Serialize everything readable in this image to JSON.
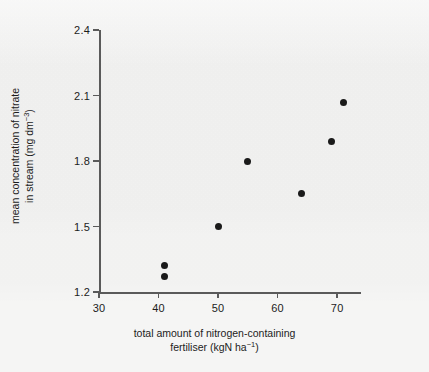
{
  "chart_data": {
    "type": "scatter",
    "title": "",
    "xlabel_line1": "total amount of nitrogen-containing",
    "xlabel_line2_pre": "fertiliser (kgN ha",
    "xlabel_line2_sup": "−1",
    "xlabel_line2_post": ")",
    "ylabel_line1": "mean concentration of nitrate",
    "ylabel_line2_pre": "in stream (mg dm",
    "ylabel_line2_sup": "−3",
    "ylabel_line2_post": ")",
    "xlim": [
      30,
      74
    ],
    "ylim": [
      1.2,
      2.4
    ],
    "xticks": [
      30,
      40,
      50,
      60,
      70
    ],
    "xtick_labels": [
      "30",
      "40",
      "50",
      "60",
      "70"
    ],
    "yticks": [
      1.2,
      1.5,
      1.8,
      2.1,
      2.4
    ],
    "ytick_labels": [
      "1.2",
      "1.5",
      "1.8",
      "2.1",
      "2.4"
    ],
    "grid": false,
    "legend": false,
    "marker_color": "#1a1a1a",
    "axis_color": "#5a5a5a",
    "background_color": "#f5f5f4",
    "points": [
      {
        "x": 41,
        "y": 1.32
      },
      {
        "x": 41,
        "y": 1.27
      },
      {
        "x": 50,
        "y": 1.5
      },
      {
        "x": 55,
        "y": 1.8
      },
      {
        "x": 64,
        "y": 1.65
      },
      {
        "x": 69,
        "y": 1.89
      },
      {
        "x": 71,
        "y": 2.07
      }
    ],
    "x": [
      41,
      41,
      50,
      55,
      64,
      69,
      71
    ],
    "values": [
      1.32,
      1.27,
      1.5,
      1.8,
      1.65,
      1.89,
      2.07
    ]
  }
}
